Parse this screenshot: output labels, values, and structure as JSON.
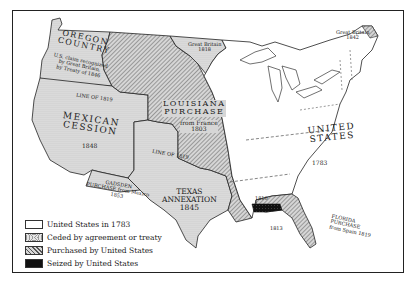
{
  "map": {
    "regions": [
      {
        "id": "oregon",
        "lines": [
          "OREGON",
          "COUNTRY"
        ],
        "sub": [
          "U.S. claim recognized",
          "by Great Britain,",
          "by Treaty of 1846"
        ]
      },
      {
        "id": "louisiana",
        "lines": [
          "LOUISIANA",
          "PURCHASE"
        ],
        "sub": [
          "from France",
          "1803"
        ]
      },
      {
        "id": "mexican",
        "lines": [
          "MEXICAN",
          "CESSION"
        ],
        "sub": [
          "1848"
        ]
      },
      {
        "id": "texas",
        "lines": [
          "TEXAS",
          "ANNEXATION"
        ],
        "sub": [
          "1845"
        ]
      },
      {
        "id": "us",
        "lines": [
          "UNITED",
          "STATES"
        ],
        "sub": [
          "1783"
        ]
      },
      {
        "id": "florida",
        "lines": [
          "FLORIDA",
          "PURCHASE"
        ],
        "sub": [
          "from Spain 1819"
        ]
      },
      {
        "id": "gadsden",
        "lines": [
          "GADSDEN",
          "PURCHASE from Mexico",
          "1853"
        ]
      }
    ],
    "annotations": {
      "gb_1818": [
        "Great Britain",
        "1818"
      ],
      "gb_1842": [
        "Great Britain",
        "1842"
      ],
      "line_1819_a": "LINE OF 1819",
      "line_1819_b": "LINE OF 1819",
      "seized_1810": "1810",
      "seized_1813": "1813"
    }
  },
  "legend": [
    {
      "label": "United States in 1783",
      "pattern": "white"
    },
    {
      "label": "Ceded by agreement or treaty",
      "pattern": "dotted"
    },
    {
      "label": "Purchased by United States",
      "pattern": "hatched"
    },
    {
      "label": "Seized by United States",
      "pattern": "black"
    }
  ],
  "colors": {
    "border": "#222222",
    "ceded": "#dcdcdc",
    "purchased_bg": "#cfcfcf",
    "hatch": "#555555",
    "seized": "#111111"
  }
}
